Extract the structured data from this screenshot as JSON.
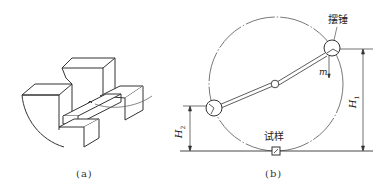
{
  "figure": {
    "panel_a": {
      "caption": "(a)",
      "description": "specimen placed on anvil supports (isometric sketch)"
    },
    "panel_b": {
      "caption": "(b)",
      "labels": {
        "hammer": "摆锤",
        "mass": "m",
        "specimen": "试样",
        "height_initial": "H",
        "height_initial_sub": "1",
        "height_final": "H",
        "height_final_sub": "2"
      }
    },
    "colors": {
      "line": "#333333",
      "arc": "#555555",
      "background": "#ffffff"
    }
  }
}
